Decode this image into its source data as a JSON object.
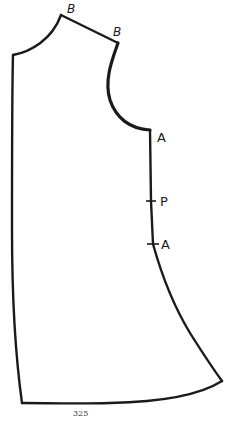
{
  "diagram": {
    "type": "sewing-pattern-piece",
    "labels": {
      "shoulder_neck_point": "B",
      "shoulder_armhole_point": "B",
      "underarm_point": "A",
      "side_notch_p": "P",
      "side_notch_a": "A"
    },
    "page_number": "325"
  },
  "colors": {
    "line": "#1a1a1a",
    "background": "#ffffff"
  }
}
